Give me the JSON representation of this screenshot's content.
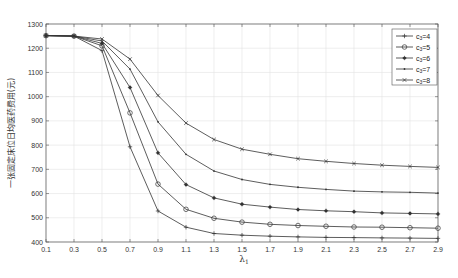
{
  "chart_data": {
    "type": "line",
    "title": "",
    "xlabel": "λ1",
    "ylabel": "一张固定床位日均医药费用(元)",
    "xlim": [
      0.1,
      2.9
    ],
    "ylim": [
      400,
      1300
    ],
    "grid": true,
    "legend_position": "upper right",
    "x": [
      0.1,
      0.3,
      0.5,
      0.7,
      0.9,
      1.1,
      1.3,
      1.5,
      1.7,
      1.9,
      2.1,
      2.3,
      2.5,
      2.7,
      2.9
    ],
    "x_ticks": [
      "0.1",
      "0.3",
      "0.5",
      "0.7",
      "0.9",
      "1.1",
      "1.3",
      "1.5",
      "1.7",
      "1.9",
      "2.1",
      "2.3",
      "2.5",
      "2.7",
      "2.9"
    ],
    "y_ticks": [
      400,
      500,
      600,
      700,
      800,
      900,
      1000,
      1100,
      1200,
      1300
    ],
    "series": [
      {
        "name": "c3=4",
        "marker": "plus",
        "values": [
          1252,
          1250,
          1190,
          793,
          528,
          461,
          435,
          428,
          424,
          421,
          419,
          418,
          417,
          416,
          415
        ]
      },
      {
        "name": "c3=5",
        "marker": "circle",
        "values": [
          1252,
          1250,
          1210,
          933,
          639,
          535,
          498,
          482,
          473,
          468,
          465,
          462,
          461,
          459,
          457
        ]
      },
      {
        "name": "c3=6",
        "marker": "star",
        "values": [
          1252,
          1250,
          1220,
          1038,
          768,
          637,
          582,
          556,
          544,
          534,
          529,
          525,
          520,
          518,
          516
        ]
      },
      {
        "name": "c3=7",
        "marker": "point",
        "values": [
          1252,
          1250,
          1230,
          1114,
          896,
          762,
          693,
          658,
          638,
          626,
          617,
          610,
          607,
          605,
          602
        ]
      },
      {
        "name": "c3=8",
        "marker": "cross",
        "values": [
          1252,
          1250,
          1238,
          1155,
          1005,
          891,
          823,
          783,
          762,
          744,
          733,
          724,
          717,
          712,
          708
        ]
      }
    ]
  },
  "colors": {
    "line": "#333333",
    "grid": "#e3e3e3",
    "axis": "#555555"
  }
}
